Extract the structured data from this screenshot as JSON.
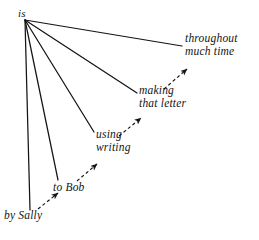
{
  "figure": {
    "type": "linguistic-dependency-tree",
    "background_color": "#ffffff",
    "ink_color": "#141414",
    "head_node": {
      "label": "is",
      "x": 18,
      "y": 7
    },
    "dependents": [
      {
        "id": "throughout-much-time",
        "lines": [
          "throughout",
          "much time"
        ],
        "x": 185,
        "y": 32
      },
      {
        "id": "making-that-letter",
        "lines": [
          "making",
          "that letter"
        ],
        "x": 139,
        "y": 84
      },
      {
        "id": "using-writing",
        "lines": [
          "using",
          "writing"
        ],
        "x": 96,
        "y": 128
      },
      {
        "id": "to-bob",
        "lines": [
          "to Bob"
        ],
        "x": 53,
        "y": 181
      },
      {
        "id": "by-sally",
        "lines": [
          "by Sally"
        ],
        "x": 4,
        "y": 209
      }
    ],
    "solid_edges": [
      {
        "from": "is",
        "to": "by-sally",
        "x1": 25,
        "y1": 20,
        "x2": 30,
        "y2": 210
      },
      {
        "from": "is",
        "to": "to-bob",
        "x1": 25,
        "y1": 20,
        "x2": 58,
        "y2": 180
      },
      {
        "from": "is",
        "to": "using-writing",
        "x1": 25,
        "y1": 20,
        "x2": 94,
        "y2": 132
      },
      {
        "from": "is",
        "to": "making-that-letter",
        "x1": 25,
        "y1": 20,
        "x2": 137,
        "y2": 93
      },
      {
        "from": "is",
        "to": "throughout-much-time",
        "x1": 25,
        "y1": 20,
        "x2": 182,
        "y2": 46
      }
    ],
    "dashed_arrows": [
      {
        "from": "by-sally",
        "to": "to-bob",
        "x1": 38,
        "y1": 209,
        "x2": 58,
        "y2": 193
      },
      {
        "from": "to-bob",
        "to": "using-writing",
        "x1": 77,
        "y1": 181,
        "x2": 97,
        "y2": 164
      },
      {
        "from": "using-writing",
        "to": "making-that-letter",
        "x1": 119,
        "y1": 136,
        "x2": 141,
        "y2": 118
      },
      {
        "from": "making-that-letter",
        "to": "throughout-much-time",
        "x1": 164,
        "y1": 89,
        "x2": 187,
        "y2": 69
      }
    ],
    "page_number": ""
  }
}
